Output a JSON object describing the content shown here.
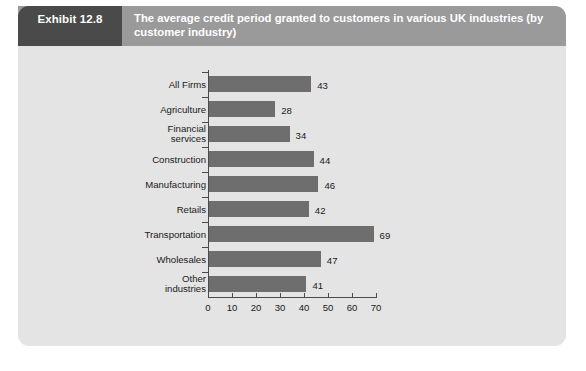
{
  "exhibit": {
    "tag": "Exhibit 12.8",
    "title": "The average credit period granted to customers in various UK industries (by customer industry)"
  },
  "colors": {
    "tag_background": "#4a4a4a",
    "header_background": "#9a9a9a",
    "panel_background": "#e4e4e4",
    "bar_fill": "#6e6e6e",
    "axis": "#4a4a4a",
    "text": "#1a1a1a",
    "header_text": "#ffffff"
  },
  "chart_data": {
    "type": "bar",
    "orientation": "horizontal",
    "title": "The average credit period granted to customers in various UK industries (by customer industry)",
    "xlabel": "",
    "ylabel": "",
    "categories": [
      "All Firms",
      "Agriculture",
      "Financial\nservices",
      "Construction",
      "Manufacturing",
      "Retails",
      "Transportation",
      "Wholesales",
      "Other\nindustries"
    ],
    "values": [
      43,
      28,
      34,
      44,
      46,
      42,
      69,
      47,
      41
    ],
    "data_labels": [
      "43",
      "28",
      "34",
      "44",
      "46",
      "42",
      "69",
      "47",
      "41"
    ],
    "xlim": [
      0,
      70
    ],
    "xticks": [
      0,
      10,
      20,
      30,
      40,
      50,
      60,
      70
    ],
    "xtick_labels": [
      "0",
      "10",
      "20",
      "30",
      "40",
      "50",
      "60",
      "70"
    ],
    "grid": false,
    "legend": false,
    "series_name": "Average credit period (days)"
  },
  "footnote": ""
}
